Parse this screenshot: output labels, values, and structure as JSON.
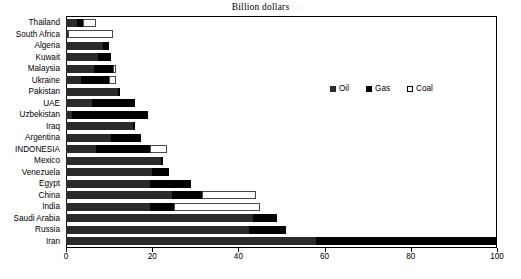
{
  "chart_data": {
    "type": "bar",
    "orientation": "horizontal",
    "stacked": true,
    "title": "Billion dollars",
    "xlabel": "",
    "ylabel": "",
    "xlim": [
      0,
      100
    ],
    "xticks": [
      0,
      20,
      40,
      60,
      80,
      100
    ],
    "grid": false,
    "legend_position": "upper-right-inside",
    "categories": [
      "Thailand",
      "South Africa",
      "Algeria",
      "Kuwait",
      "Malaysia",
      "Ukraine",
      "Pakistan",
      "UAE",
      "Uzbekistan",
      "Iraq",
      "Argentina",
      "INDONESIA",
      "Mexico",
      "Venezuela",
      "Egypt",
      "China",
      "India",
      "Saudi Arabia",
      "Russia",
      "Iran"
    ],
    "series": [
      {
        "name": "Oil",
        "color": "#2b2b2b",
        "values": [
          2.5,
          0.5,
          8.5,
          7.5,
          6.5,
          3.5,
          12.0,
          6.0,
          1.5,
          15.5,
          10.5,
          7.0,
          22.0,
          20.0,
          19.5,
          24.5,
          19.5,
          43.5,
          42.5,
          58.0
        ]
      },
      {
        "name": "Gas",
        "color": "#000000",
        "values": [
          1.5,
          0.0,
          1.5,
          3.0,
          4.5,
          6.5,
          0.5,
          10.0,
          17.5,
          0.5,
          7.0,
          12.5,
          0.5,
          4.0,
          9.5,
          7.0,
          5.5,
          5.5,
          8.5,
          42.0
        ]
      },
      {
        "name": "Coal",
        "color": "#ffffff",
        "values": [
          3.0,
          10.5,
          0.0,
          0.0,
          0.5,
          1.5,
          0.0,
          0.0,
          0.0,
          0.0,
          0.0,
          4.0,
          0.0,
          0.0,
          0.0,
          12.5,
          20.0,
          0.0,
          0.0,
          0.0
        ]
      }
    ],
    "totals": [
      7.0,
      11.0,
      10.0,
      10.5,
      11.5,
      11.5,
      12.5,
      16.0,
      19.0,
      16.0,
      17.5,
      23.5,
      22.5,
      24.0,
      29.0,
      44.0,
      45.0,
      49.0,
      51.0,
      100.0
    ]
  },
  "legend": {
    "items": [
      {
        "label": "Oil"
      },
      {
        "label": "Gas"
      },
      {
        "label": "Coal"
      }
    ]
  },
  "axis": {
    "tick_labels": [
      "0",
      "20",
      "40",
      "60",
      "80",
      "100"
    ]
  }
}
